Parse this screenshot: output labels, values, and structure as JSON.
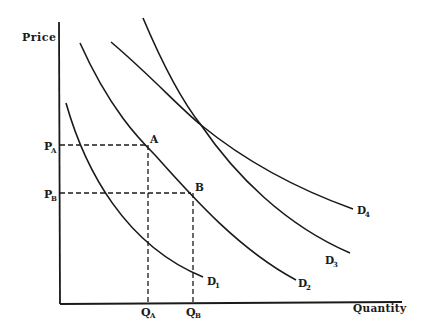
{
  "diagram": {
    "title": "",
    "axes": {
      "y_label": "Price",
      "x_label": "Quantity"
    },
    "price_levels": [
      {
        "id": "PA",
        "label": "P",
        "sub": "A"
      },
      {
        "id": "PB",
        "label": "P",
        "sub": "B"
      }
    ],
    "quantity_levels": [
      {
        "id": "QA",
        "label": "Q",
        "sub": "A"
      },
      {
        "id": "QB",
        "label": "Q",
        "sub": "B"
      }
    ],
    "points": [
      {
        "id": "A",
        "label": "A",
        "on_curve": "D2"
      },
      {
        "id": "B",
        "label": "B",
        "on_curve": "D2"
      }
    ],
    "curves": [
      {
        "id": "D1",
        "label": "D",
        "sub": "1"
      },
      {
        "id": "D2",
        "label": "D",
        "sub": "2"
      },
      {
        "id": "D3",
        "label": "D",
        "sub": "3"
      },
      {
        "id": "D4",
        "label": "D",
        "sub": "4"
      }
    ],
    "colors": {
      "ink": "#1a1a1a",
      "background": "#ffffff"
    }
  }
}
